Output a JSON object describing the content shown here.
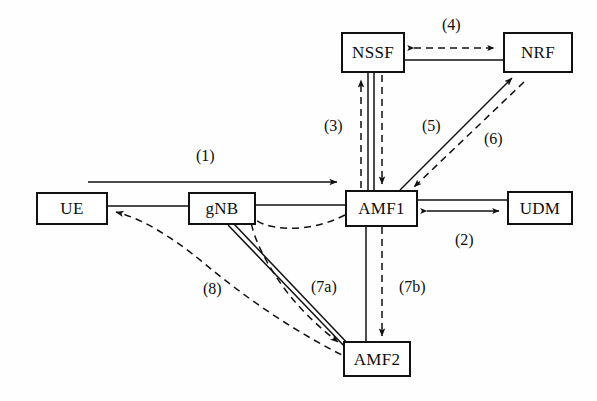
{
  "diagram": {
    "type": "network-sequence-diagram",
    "background_color": "#fefefe",
    "line_color": "#111111",
    "text_color": "#0d0d0d",
    "nodes": [
      {
        "id": "ue",
        "label": "UE",
        "x": 36,
        "y": 192,
        "w": 72,
        "h": 33
      },
      {
        "id": "gnb",
        "label": "gNB",
        "x": 188,
        "y": 192,
        "w": 68,
        "h": 33
      },
      {
        "id": "amf1",
        "label": "AMF1",
        "x": 345,
        "y": 190,
        "w": 73,
        "h": 37
      },
      {
        "id": "udm",
        "label": "UDM",
        "x": 507,
        "y": 191,
        "w": 66,
        "h": 34
      },
      {
        "id": "nssf",
        "label": "NSSF",
        "x": 341,
        "y": 32,
        "w": 64,
        "h": 41
      },
      {
        "id": "nrf",
        "label": "NRF",
        "x": 503,
        "y": 32,
        "w": 70,
        "h": 41
      },
      {
        "id": "amf2",
        "label": "AMF2",
        "x": 343,
        "y": 341,
        "w": 68,
        "h": 36
      }
    ],
    "edge_labels": [
      {
        "id": "e1",
        "label": "(1)",
        "x": 196,
        "y": 148
      },
      {
        "id": "e2",
        "label": "(2)",
        "x": 455,
        "y": 232
      },
      {
        "id": "e3",
        "label": "(3)",
        "x": 324,
        "y": 118
      },
      {
        "id": "e4",
        "label": "(4)",
        "x": 442,
        "y": 17
      },
      {
        "id": "e5",
        "label": "(5)",
        "x": 422,
        "y": 118
      },
      {
        "id": "e6",
        "label": "(6)",
        "x": 484,
        "y": 131
      },
      {
        "id": "e7a",
        "label": "(7a)",
        "x": 311,
        "y": 279
      },
      {
        "id": "e7b",
        "label": "(7b)",
        "x": 399,
        "y": 279
      },
      {
        "id": "e8",
        "label": "(8)",
        "x": 203,
        "y": 281
      }
    ],
    "connections": [
      {
        "id": "c1",
        "from": "ue",
        "to": "amf1",
        "style": "solid",
        "arrow": "end",
        "ref": "(1)"
      },
      {
        "id": "c2",
        "from": "amf1",
        "to": "udm",
        "style": "solid",
        "arrow": "both",
        "ref": "(2)"
      },
      {
        "id": "c3",
        "from": "amf1",
        "to": "nssf",
        "style": "dashed",
        "arrow": "end",
        "ref": "(3)"
      },
      {
        "id": "c3b",
        "from": "nssf",
        "to": "amf1",
        "style": "dashed",
        "arrow": "end",
        "ref": "(3)"
      },
      {
        "id": "c4",
        "from": "nssf",
        "to": "nrf",
        "style": "dashed",
        "arrow": "both",
        "ref": "(4)"
      },
      {
        "id": "c5",
        "from": "amf1",
        "to": "nrf",
        "style": "solid",
        "arrow": "end",
        "ref": "(5)"
      },
      {
        "id": "c6",
        "from": "nrf",
        "to": "amf1",
        "style": "dashed",
        "arrow": "end",
        "ref": "(6)"
      },
      {
        "id": "c7a",
        "from": "amf1",
        "to": "amf2",
        "style": "dashed",
        "arrow": "end",
        "ref": "(7a)"
      },
      {
        "id": "c7b",
        "from": "amf1",
        "to": "amf2",
        "style": "dashed",
        "arrow": "end",
        "ref": "(7b)"
      },
      {
        "id": "c8",
        "from": "amf2",
        "to": "ue",
        "style": "dashed",
        "arrow": "end",
        "ref": "(8)"
      }
    ]
  }
}
